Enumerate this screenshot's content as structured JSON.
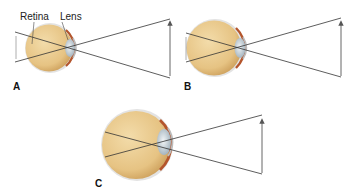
{
  "labels": {
    "retina": "Retina",
    "lens": "Lens"
  },
  "panels": [
    {
      "id": "A",
      "label": "A",
      "eye": {
        "cx": 50,
        "cy": 48,
        "r": 24
      },
      "arrow": {
        "x": 170,
        "y1": 76,
        "y2": 21
      },
      "image_arrow": {
        "x": 16,
        "y1": 35,
        "y2": 60
      }
    },
    {
      "id": "B",
      "label": "B",
      "eye": {
        "cx": 216,
        "cy": 48,
        "r": 28
      },
      "arrow": {
        "x": 341,
        "y1": 76,
        "y2": 21
      },
      "image_arrow": {
        "x": 186,
        "y1": 37,
        "y2": 60
      }
    },
    {
      "id": "C",
      "label": "C",
      "eye": {
        "cx": 136,
        "cy": 145,
        "r": 34
      },
      "arrow": {
        "x": 262,
        "y1": 173,
        "y2": 119
      },
      "image_arrow": null
    }
  ],
  "colors": {
    "eye_fill": "#e9c98a",
    "eye_shade": "#d4a860",
    "sclera_edge": "#cfcfcf",
    "choroid": "#b4552c",
    "lens": "#cdd6dc",
    "ray": "#333333",
    "arrow": "#555555"
  }
}
